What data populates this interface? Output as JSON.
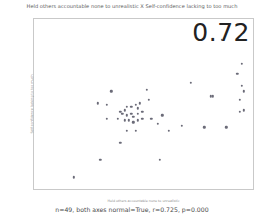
{
  "chart_data": {
    "type": "scatter",
    "title": "Held others accountable none to unrealistic X Self-confidence lacking to too much",
    "xlabel": "Held others accountable none to unrealistic",
    "ylabel": "Self-confidence lacking to too much",
    "xlim": [
      5,
      105
    ],
    "ylim": [
      5,
      105
    ],
    "xticks": [
      20,
      40,
      60,
      80,
      100
    ],
    "yticks": [
      20,
      40,
      60,
      80,
      100
    ],
    "grid": false,
    "legend": null,
    "annotation": "0.72",
    "marker_color": "#6b6b78",
    "points": [
      {
        "x": 90,
        "y": 93
      },
      {
        "x": 99,
        "y": 79
      },
      {
        "x": 97,
        "y": 73
      },
      {
        "x": 99,
        "y": 66
      },
      {
        "x": 100,
        "y": 63
      },
      {
        "x": 76,
        "y": 68
      },
      {
        "x": 56,
        "y": 64
      },
      {
        "x": 40,
        "y": 63
      },
      {
        "x": 98,
        "y": 58
      },
      {
        "x": 85,
        "y": 60
      },
      {
        "x": 86,
        "y": 60
      },
      {
        "x": 57,
        "y": 58
      },
      {
        "x": 34,
        "y": 56
      },
      {
        "x": 38,
        "y": 55
      },
      {
        "x": 100,
        "y": 52
      },
      {
        "x": 98,
        "y": 51
      },
      {
        "x": 46,
        "y": 52
      },
      {
        "x": 47,
        "y": 54
      },
      {
        "x": 49,
        "y": 54
      },
      {
        "x": 51,
        "y": 55
      },
      {
        "x": 52,
        "y": 53
      },
      {
        "x": 53,
        "y": 56
      },
      {
        "x": 44,
        "y": 51
      },
      {
        "x": 45,
        "y": 50
      },
      {
        "x": 47,
        "y": 49
      },
      {
        "x": 49,
        "y": 50
      },
      {
        "x": 50,
        "y": 48
      },
      {
        "x": 52,
        "y": 50
      },
      {
        "x": 54,
        "y": 51
      },
      {
        "x": 46,
        "y": 46
      },
      {
        "x": 48,
        "y": 46
      },
      {
        "x": 50,
        "y": 45
      },
      {
        "x": 52,
        "y": 46
      },
      {
        "x": 54,
        "y": 47
      },
      {
        "x": 43,
        "y": 47
      },
      {
        "x": 38,
        "y": 47
      },
      {
        "x": 58,
        "y": 47
      },
      {
        "x": 63,
        "y": 49
      },
      {
        "x": 61,
        "y": 44
      },
      {
        "x": 72,
        "y": 43
      },
      {
        "x": 82,
        "y": 42
      },
      {
        "x": 92,
        "y": 42
      },
      {
        "x": 66,
        "y": 40
      },
      {
        "x": 51,
        "y": 40
      },
      {
        "x": 47,
        "y": 40
      },
      {
        "x": 44,
        "y": 33
      },
      {
        "x": 62,
        "y": 23
      },
      {
        "x": 35,
        "y": 23
      },
      {
        "x": 23,
        "y": 13
      }
    ]
  },
  "caption": "n=49, both axes normal=True, r=0.725, p=0.000"
}
